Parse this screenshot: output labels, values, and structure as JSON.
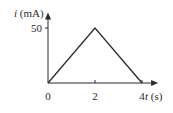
{
  "chart_data": {
    "type": "line",
    "title": "",
    "xlabel_var": "t",
    "xlabel_unit": " (s)",
    "ylabel_var": "i",
    "ylabel_unit": " (mA)",
    "x": [
      0,
      2,
      4
    ],
    "series": [
      {
        "name": "i(t)",
        "values": [
          0,
          50,
          0
        ]
      }
    ],
    "xticks": [
      0,
      2,
      4
    ],
    "xtick_labels": [
      "0",
      "2",
      "4"
    ],
    "yticks": [
      50
    ],
    "ytick_labels": [
      "50"
    ],
    "xlim": [
      0,
      4.6
    ],
    "ylim": [
      0,
      65
    ],
    "grid": false,
    "legend": "none",
    "colors": {
      "line": "#2a2a2a",
      "axes": "#2a2a2a"
    }
  }
}
